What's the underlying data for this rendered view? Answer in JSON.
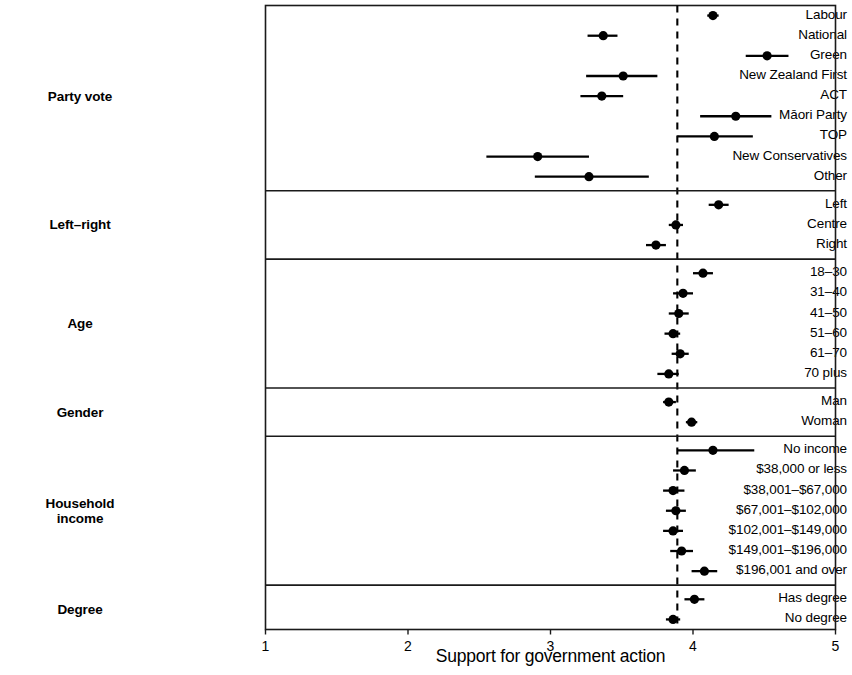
{
  "chart_data": {
    "type": "scatter",
    "subtype": "dot-and-whisker coefficient plot",
    "title": "",
    "xlabel": "Support for government action",
    "ylabel": "",
    "xlim": [
      1,
      5
    ],
    "xticks": [
      1,
      2,
      3,
      4,
      5
    ],
    "xticklabels": [
      "1",
      "2",
      "3",
      "4",
      "5"
    ],
    "grid": false,
    "reference_line": {
      "x": 3.89,
      "style": "dashed"
    },
    "groups": [
      {
        "name": "Party vote",
        "rows": [
          {
            "label": "Labour",
            "value": 4.14,
            "low": 4.1,
            "high": 4.18
          },
          {
            "label": "National",
            "value": 3.37,
            "low": 3.26,
            "high": 3.47
          },
          {
            "label": "Green",
            "value": 4.52,
            "low": 4.37,
            "high": 4.67
          },
          {
            "label": "New Zealand First",
            "value": 3.51,
            "low": 3.25,
            "high": 3.75
          },
          {
            "label": "ACT",
            "value": 3.36,
            "low": 3.21,
            "high": 3.51
          },
          {
            "label": "Māori Party",
            "value": 4.3,
            "low": 4.05,
            "high": 4.55
          },
          {
            "label": "TOP",
            "value": 4.15,
            "low": 3.89,
            "high": 4.42
          },
          {
            "label": "New Conservatives",
            "value": 2.91,
            "low": 2.55,
            "high": 3.27
          },
          {
            "label": "Other",
            "value": 3.27,
            "low": 2.89,
            "high": 3.69
          }
        ]
      },
      {
        "name": "Left–right",
        "rows": [
          {
            "label": "Left",
            "value": 4.18,
            "low": 4.11,
            "high": 4.25
          },
          {
            "label": "Centre",
            "value": 3.88,
            "low": 3.83,
            "high": 3.93
          },
          {
            "label": "Right",
            "value": 3.74,
            "low": 3.67,
            "high": 3.81
          }
        ]
      },
      {
        "name": "Age",
        "rows": [
          {
            "label": "18–30",
            "value": 4.07,
            "low": 4.0,
            "high": 4.14
          },
          {
            "label": "31–40",
            "value": 3.93,
            "low": 3.86,
            "high": 4.0
          },
          {
            "label": "41–50",
            "value": 3.9,
            "low": 3.83,
            "high": 3.97
          },
          {
            "label": "51–60",
            "value": 3.86,
            "low": 3.8,
            "high": 3.91
          },
          {
            "label": "61–70",
            "value": 3.91,
            "low": 3.85,
            "high": 3.97
          },
          {
            "label": "70 plus",
            "value": 3.83,
            "low": 3.75,
            "high": 3.9
          }
        ]
      },
      {
        "name": "Gender",
        "rows": [
          {
            "label": "Man",
            "value": 3.83,
            "low": 3.79,
            "high": 3.88
          },
          {
            "label": "Woman",
            "value": 3.99,
            "low": 3.95,
            "high": 4.03
          }
        ]
      },
      {
        "name": "Household\nincome",
        "rows": [
          {
            "label": "No income",
            "value": 4.14,
            "low": 3.89,
            "high": 4.43
          },
          {
            "label": "$38,000 or less",
            "value": 3.94,
            "low": 3.86,
            "high": 4.02
          },
          {
            "label": "$38,001–$67,000",
            "value": 3.86,
            "low": 3.79,
            "high": 3.94
          },
          {
            "label": "$67,001–$102,000",
            "value": 3.88,
            "low": 3.81,
            "high": 3.95
          },
          {
            "label": "$102,001–$149,000",
            "value": 3.86,
            "low": 3.79,
            "high": 3.93
          },
          {
            "label": "$149,001–$196,000",
            "value": 3.92,
            "low": 3.84,
            "high": 4.0
          },
          {
            "label": "$196,001 and over",
            "value": 4.08,
            "low": 3.99,
            "high": 4.17
          }
        ]
      },
      {
        "name": "Degree",
        "rows": [
          {
            "label": "Has degree",
            "value": 4.01,
            "low": 3.94,
            "high": 4.08
          },
          {
            "label": "No degree",
            "value": 3.86,
            "low": 3.81,
            "high": 3.91
          }
        ]
      }
    ]
  },
  "colors": {
    "ink": "#000000",
    "background": "#ffffff",
    "axis": "#1a1a1a"
  }
}
